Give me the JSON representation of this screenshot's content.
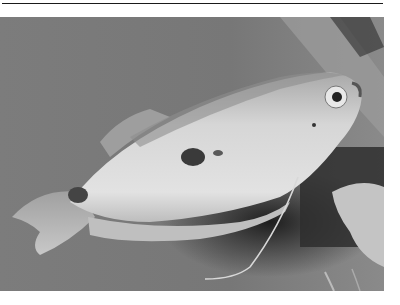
{
  "image": {
    "subject": "gourami fish",
    "style": "grayscale photograph",
    "colors": {
      "background": "#7a7a7a",
      "background_dark": "#2a2a2a",
      "body_light": "#d8d8d8",
      "body_mid": "#b5b5b5",
      "spot": "#3a3a3a",
      "rule": "#1a1a1a"
    }
  }
}
